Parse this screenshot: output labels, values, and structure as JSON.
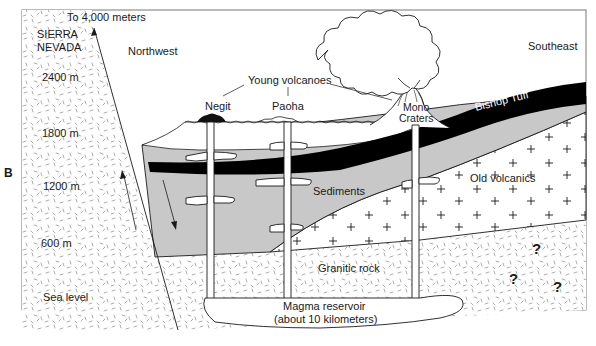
{
  "figure": {
    "panel_label": "B",
    "orientation": {
      "left": "Northwest",
      "right": "Southeast"
    },
    "colors": {
      "background": "#ffffff",
      "sediments_fill": "#c8c8c8",
      "bishop_tuff_fill": "#000000",
      "outline": "#1a1a1a",
      "granite_dash": "#8a8a8a"
    },
    "mountain": {
      "name_line1": "SIERRA",
      "name_line2": "NEVADA",
      "peak_note": "To 4,000 meters"
    },
    "elevations": [
      {
        "label": "2400 m"
      },
      {
        "label": "1800 m"
      },
      {
        "label": "1200 m"
      },
      {
        "label": "600 m"
      },
      {
        "label": "Sea level"
      }
    ],
    "volcanoes": {
      "group_label": "Young volcanoes",
      "items": [
        {
          "name": "Negit"
        },
        {
          "name": "Paoha"
        },
        {
          "name_line1": "Mono",
          "name_line2": "Craters"
        }
      ]
    },
    "layers": {
      "bishop_tuff": "Bishop Tuff",
      "sediments": "Sediments",
      "old_volcanics": "Old volcanics",
      "granitic_rock": "Granitic rock",
      "magma_line1": "Magma reservoir",
      "magma_line2": "(about 10 kilometers)"
    },
    "unknown_markers": [
      "?",
      "?",
      "?"
    ]
  }
}
